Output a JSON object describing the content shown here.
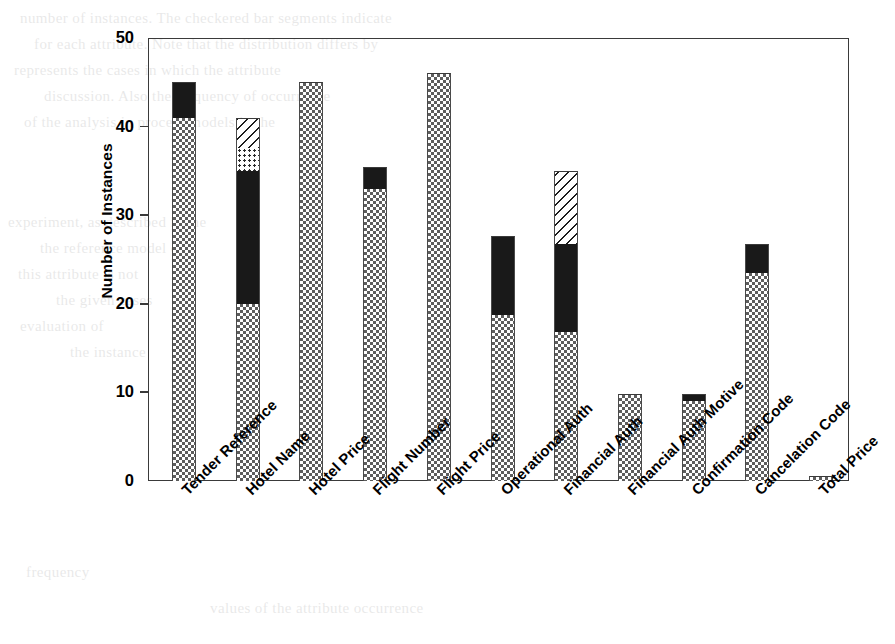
{
  "chart_data": {
    "type": "bar",
    "stacked": true,
    "title": "",
    "xlabel": "",
    "ylabel": "Number of Instances",
    "ylim": [
      0,
      50
    ],
    "yticks": [
      0,
      10,
      20,
      30,
      40,
      50
    ],
    "ytick_labels": [
      "0",
      "10",
      "20",
      "30",
      "40",
      "50"
    ],
    "grid": false,
    "legend": "none",
    "categories": [
      "Tender Reference",
      "Hotel Name",
      "Hotel Price",
      "Flight Number",
      "Flight Price",
      "Operational Auth",
      "Financial Auth",
      "Financial Auth Motive",
      "Confirmation Code",
      "Cancelation Code",
      "Total Price"
    ],
    "series": [
      {
        "name": "checker",
        "pattern": "checkerboard",
        "color": "#5d5d5d",
        "values": [
          41,
          20,
          45,
          33,
          46,
          18.7,
          16.8,
          9.8,
          9,
          23.5,
          0.6
        ]
      },
      {
        "name": "solid",
        "pattern": "solid-black",
        "color": "#191919",
        "values": [
          4,
          15,
          0,
          2.4,
          0,
          9,
          10,
          0,
          0.8,
          3.2,
          0
        ]
      },
      {
        "name": "dots",
        "pattern": "dotted",
        "color": "#2a2a2a",
        "values": [
          0,
          2.6,
          0,
          0,
          0,
          0,
          0,
          0,
          0,
          0,
          0
        ]
      },
      {
        "name": "hatch",
        "pattern": "diagonal-hatch",
        "color": "#1d1d1d",
        "values": [
          0,
          3.4,
          0,
          0,
          0,
          0,
          8.2,
          0,
          0,
          0,
          0
        ]
      }
    ],
    "totals": [
      45,
      41,
      45,
      35.4,
      46,
      27.7,
      35,
      9.8,
      9.8,
      26.7,
      0.6
    ]
  },
  "background_text": [
    {
      "text": "number of instances. The checkered bar segments indicate",
      "x": 20,
      "y": 6
    },
    {
      "text": "for each attribute. Note that the distribution differs by",
      "x": 34,
      "y": 32
    },
    {
      "text": "represents the cases in which the attribute",
      "x": 14,
      "y": 58
    },
    {
      "text": "discussion. Also the frequency of occurrence",
      "x": 44,
      "y": 84
    },
    {
      "text": "of the analysis in process models in the",
      "x": 24,
      "y": 110
    },
    {
      "text": "experiment, as described in the",
      "x": 8,
      "y": 210
    },
    {
      "text": "the reference model of",
      "x": 40,
      "y": 236
    },
    {
      "text": "this attribute is not",
      "x": 18,
      "y": 262
    },
    {
      "text": "the given cases",
      "x": 56,
      "y": 288
    },
    {
      "text": "evaluation of",
      "x": 20,
      "y": 314
    },
    {
      "text": "the instance",
      "x": 70,
      "y": 340
    },
    {
      "text": "frequency",
      "x": 26,
      "y": 560
    },
    {
      "text": "values of the attribute occurrence",
      "x": 210,
      "y": 596
    }
  ]
}
